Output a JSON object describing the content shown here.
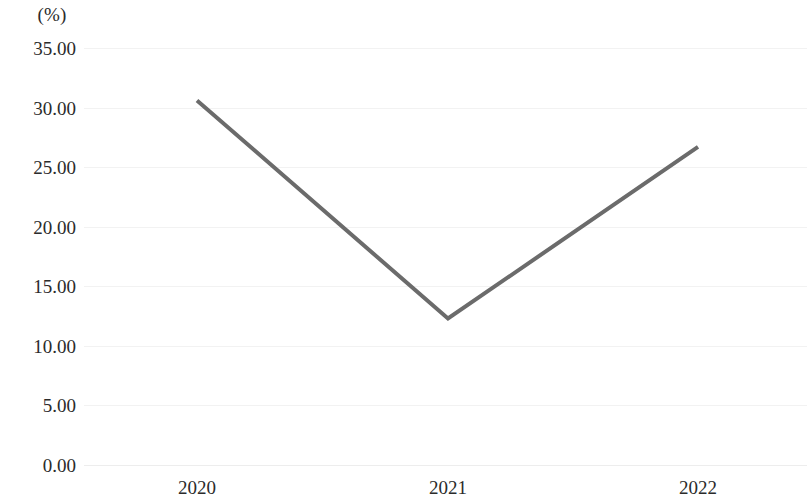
{
  "chart_data": {
    "type": "line",
    "title": "",
    "subtitle": "",
    "xlabel": "",
    "ylabel": "",
    "unit_label": "(%)",
    "categories": [
      "2020",
      "2021",
      "2022"
    ],
    "series": [
      {
        "name": "",
        "values": [
          30.6,
          12.3,
          26.7
        ],
        "color": "#6b6b6b"
      }
    ],
    "ylim": [
      0,
      35
    ],
    "ytick_values": [
      35,
      30,
      25,
      20,
      15,
      10,
      5,
      0
    ],
    "ytick_labels": [
      "35.00",
      "30.00",
      "25.00",
      "20.00",
      "15.00",
      "10.00",
      "5.00",
      "0.00"
    ],
    "xtick_labels": [
      "2020",
      "2021",
      "2022"
    ],
    "grid": true,
    "grid_color": "#f2f2f2",
    "legend": false,
    "legend_position": "none",
    "markers": false,
    "line_width": 4,
    "background_color": "#ffffff",
    "text_color": "#2b2b2b"
  },
  "axes": {
    "y": {
      "ticks": [
        {
          "label": "35.00",
          "value": 35
        },
        {
          "label": "30.00",
          "value": 30
        },
        {
          "label": "25.00",
          "value": 25
        },
        {
          "label": "20.00",
          "value": 20
        },
        {
          "label": "15.00",
          "value": 15
        },
        {
          "label": "10.00",
          "value": 10
        },
        {
          "label": "5.00",
          "value": 5
        },
        {
          "label": "0.00",
          "value": 0
        }
      ]
    },
    "x": {
      "ticks": [
        {
          "label": "2020",
          "value": 30.6
        },
        {
          "label": "2021",
          "value": 12.3
        },
        {
          "label": "2022",
          "value": 26.7
        }
      ]
    }
  }
}
